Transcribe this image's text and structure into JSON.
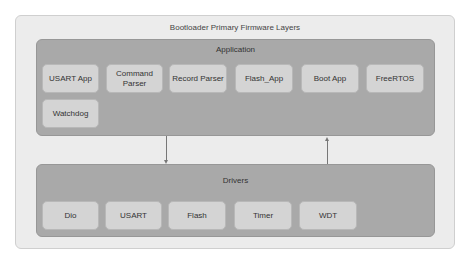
{
  "diagram": {
    "title": "Bootloader Primary Firmware Layers",
    "layers": {
      "application": {
        "label": "Application",
        "components": [
          {
            "label": "USART App"
          },
          {
            "label": "Command Parser"
          },
          {
            "label": "Record Parser"
          },
          {
            "label": "Flash_App"
          },
          {
            "label": "Boot App"
          },
          {
            "label": "FreeRTOS"
          },
          {
            "label": "Watchdog"
          }
        ]
      },
      "drivers": {
        "label": "Drivers",
        "components": [
          {
            "label": "Dio"
          },
          {
            "label": "USART"
          },
          {
            "label": "Flash"
          },
          {
            "label": "Timer"
          },
          {
            "label": "WDT"
          }
        ]
      }
    },
    "connections": [
      {
        "from": "Application",
        "to": "Drivers",
        "direction": "down"
      },
      {
        "from": "Drivers",
        "to": "Application",
        "direction": "up"
      }
    ],
    "colors": {
      "outer_background": "#ececec",
      "layer_background": "#a9a9a9",
      "component_background": "#d4d4d4",
      "arrow": "#777777"
    }
  }
}
